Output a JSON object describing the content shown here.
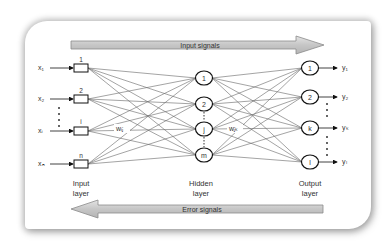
{
  "diagram": {
    "top_arrow": {
      "label": "Input signals",
      "direction": "right"
    },
    "bottom_arrow": {
      "label": "Error signals",
      "direction": "left"
    },
    "inputs": [
      {
        "var": "x₁",
        "node": "1"
      },
      {
        "var": "x₂",
        "node": "2"
      },
      {
        "var": "xᵢ",
        "node": "i"
      },
      {
        "var": "xₙ",
        "node": "n"
      }
    ],
    "hidden": [
      "1",
      "2",
      "j",
      "m"
    ],
    "outputs": [
      {
        "node": "1",
        "var": "y₁"
      },
      {
        "node": "2",
        "var": "y₂"
      },
      {
        "node": "k",
        "var": "yₖ"
      },
      {
        "node": "l",
        "var": "yₗ"
      }
    ],
    "weights": {
      "input_hidden": "wᵢⱼ",
      "hidden_output": "wⱼₖ"
    },
    "layer_labels": {
      "input": {
        "line1": "Input",
        "line2": "layer"
      },
      "hidden": {
        "line1": "Hidden",
        "line2": "layer"
      },
      "output": {
        "line1": "Output",
        "line2": "layer"
      }
    },
    "colors": {
      "arrow_fill": "#c8c8c8",
      "arrow_stroke": "#8a8a8a",
      "line": "#555555",
      "node_stroke": "#222222"
    }
  }
}
